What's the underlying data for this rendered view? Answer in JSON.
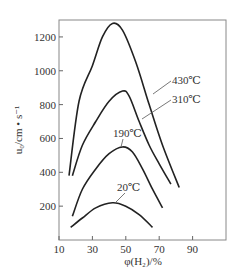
{
  "chart_data": {
    "type": "line",
    "title": "",
    "xlabel": "φ(H₂)/%",
    "ylabel": "u₀/cm • s⁻¹",
    "xlim": [
      10,
      110
    ],
    "ylim": [
      0,
      1300
    ],
    "xticks": [
      10,
      30,
      50,
      70,
      90
    ],
    "yticks": [
      200,
      400,
      600,
      800,
      1000,
      1200
    ],
    "grid": false,
    "series": [
      {
        "name": "430℃",
        "x": [
          16,
          22,
          30,
          36,
          42,
          48,
          56,
          64,
          72,
          82
        ],
        "y": [
          380,
          820,
          1030,
          1200,
          1280,
          1240,
          1050,
          800,
          560,
          310
        ]
      },
      {
        "name": "310℃",
        "x": [
          18,
          24,
          32,
          40,
          48,
          52,
          58,
          64,
          70,
          77
        ],
        "y": [
          380,
          560,
          700,
          820,
          880,
          850,
          700,
          560,
          450,
          330
        ]
      },
      {
        "name": "190℃",
        "x": [
          18,
          24,
          32,
          40,
          48,
          54,
          60,
          66,
          72
        ],
        "y": [
          140,
          300,
          420,
          510,
          550,
          520,
          420,
          300,
          190
        ]
      },
      {
        "name": "20℃",
        "x": [
          17,
          24,
          32,
          42,
          50,
          58,
          66
        ],
        "y": [
          75,
          130,
          190,
          220,
          200,
          150,
          75
        ]
      }
    ]
  }
}
